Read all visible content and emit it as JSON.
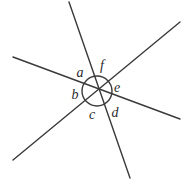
{
  "figure": {
    "background_color": "#ffffff",
    "stroke_color": "#3a3a3a",
    "label_color": "#2b2b2b",
    "stroke_width": 1.4,
    "intersection": {
      "x": 97,
      "y": 91
    },
    "circle": {
      "cx": 97,
      "cy": 91,
      "r": 15,
      "stroke_color": "#3a3a3a",
      "fill": "none"
    },
    "lines": [
      {
        "name": "line-steep",
        "x1": 69,
        "y1": 2,
        "x2": 130,
        "y2": 178
      },
      {
        "name": "line-shallow-left",
        "x1": 13,
        "y1": 57,
        "x2": 180,
        "y2": 119
      },
      {
        "name": "line-diagonal-rising",
        "x1": 13,
        "y1": 160,
        "x2": 180,
        "y2": 22
      }
    ],
    "labels": [
      {
        "name": "angle-label-a",
        "text": "a",
        "x": 80,
        "y": 73
      },
      {
        "name": "angle-label-f",
        "text": "f",
        "x": 102,
        "y": 66
      },
      {
        "name": "angle-label-e",
        "text": "e",
        "x": 117,
        "y": 88
      },
      {
        "name": "angle-label-b",
        "text": "b",
        "x": 75,
        "y": 95
      },
      {
        "name": "angle-label-c",
        "text": "c",
        "x": 92,
        "y": 115
      },
      {
        "name": "angle-label-d",
        "text": "d",
        "x": 115,
        "y": 113
      }
    ]
  }
}
